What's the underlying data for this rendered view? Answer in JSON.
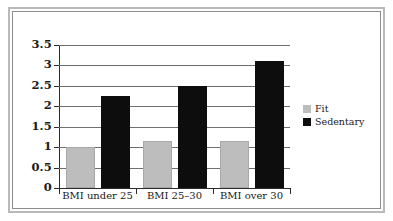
{
  "figure": {
    "frame_color": "#b9b9b9",
    "inner_frame_color": "#8e8e8e",
    "background": "#ffffff"
  },
  "legend": {
    "position": "right",
    "entries": [
      {
        "label": "Fit",
        "color": "#bdbdbd"
      },
      {
        "label": "Sedentary",
        "color": "#0d0d0d"
      }
    ]
  },
  "chart_data": {
    "type": "bar",
    "title": "",
    "subtitle": "",
    "xlabel": "",
    "ylabel": "",
    "categories": [
      "BMI under 25",
      "BMI 25–30",
      "BMI over 30"
    ],
    "series": [
      {
        "name": "Fit",
        "color": "#bdbdbd",
        "values": [
          1.0,
          1.15,
          1.15
        ]
      },
      {
        "name": "Sedentary",
        "color": "#0d0d0d",
        "values": [
          2.25,
          2.5,
          3.1
        ]
      }
    ],
    "ylim": [
      0,
      3.5
    ],
    "ytick_labels": [
      "0",
      "0.5",
      "1",
      "1.5",
      "2",
      "2.5",
      "3",
      "3.5"
    ],
    "ytick_values": [
      0,
      0.5,
      1,
      1.5,
      2,
      2.5,
      3,
      3.5
    ],
    "grid": true,
    "grid_axis": "y",
    "legend_position": "right",
    "orientation": "vertical",
    "grouped": true
  }
}
